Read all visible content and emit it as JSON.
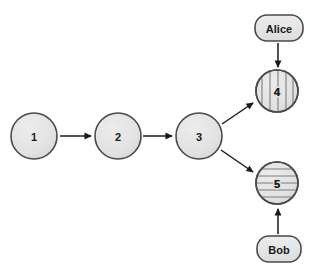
{
  "diagram": {
    "type": "node-graph",
    "background_color": "#ffffff",
    "node_fill": "#e2e2e2",
    "node_stroke": "#4a4a4a",
    "stripe_color": "#7d7d7d",
    "edge_color": "#1a1a1a",
    "text_color": "#1a1a1a",
    "commit_nodes": [
      {
        "id": "node-1",
        "label": "1",
        "cx": 34,
        "cy": 136,
        "r": 23,
        "shape": "circle",
        "pattern": "solid"
      },
      {
        "id": "node-2",
        "label": "2",
        "cx": 118,
        "cy": 136,
        "r": 23,
        "shape": "circle",
        "pattern": "solid"
      },
      {
        "id": "node-3",
        "label": "3",
        "cx": 199,
        "cy": 136,
        "r": 23,
        "shape": "circle",
        "pattern": "solid"
      },
      {
        "id": "node-4",
        "label": "4",
        "cx": 277,
        "cy": 91,
        "r": 21,
        "shape": "circle",
        "pattern": "vertical-stripes"
      },
      {
        "id": "node-5",
        "label": "5",
        "cx": 277,
        "cy": 183,
        "r": 21,
        "shape": "circle",
        "pattern": "horizontal-stripes"
      }
    ],
    "actor_nodes": [
      {
        "id": "actor-alice",
        "label": "Alice",
        "cx": 279,
        "cy": 28,
        "w": 48,
        "h": 26,
        "shape": "rounded-rect"
      },
      {
        "id": "actor-bob",
        "label": "Bob",
        "cx": 279,
        "cy": 249,
        "w": 44,
        "h": 26,
        "shape": "rounded-rect"
      }
    ],
    "edges": [
      {
        "id": "edge-1-2",
        "from": "node-1",
        "to": "node-2",
        "style": "arrow",
        "direction": "horizontal"
      },
      {
        "id": "edge-2-3",
        "from": "node-2",
        "to": "node-3",
        "style": "arrow",
        "direction": "horizontal"
      },
      {
        "id": "edge-3-4",
        "from": "node-3",
        "to": "node-4",
        "style": "arrow",
        "direction": "diagonal-up"
      },
      {
        "id": "edge-3-5",
        "from": "node-3",
        "to": "node-5",
        "style": "arrow",
        "direction": "diagonal-down"
      },
      {
        "id": "edge-alice-4",
        "from": "actor-alice",
        "to": "node-4",
        "style": "arrow",
        "direction": "vertical-down"
      },
      {
        "id": "edge-bob-5",
        "from": "actor-bob",
        "to": "node-5",
        "style": "arrow",
        "direction": "vertical-up"
      }
    ]
  }
}
